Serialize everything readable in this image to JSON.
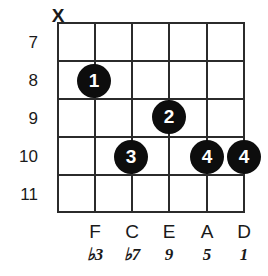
{
  "diagram": {
    "type": "guitar-chord-diagram",
    "instrument": "guitar",
    "string_count": 6,
    "fret_numbers": [
      "7",
      "8",
      "9",
      "10",
      "11"
    ],
    "mute_marker": "X",
    "strings": [
      {
        "index": 1,
        "status": "muted",
        "marker": "X",
        "note": "",
        "interval": "",
        "finger": ""
      },
      {
        "index": 2,
        "status": "fretted",
        "marker": "",
        "note": "F",
        "interval": "♭3",
        "finger": "1",
        "fret": "8"
      },
      {
        "index": 3,
        "status": "fretted",
        "marker": "",
        "note": "C",
        "interval": "♭7",
        "finger": "3",
        "fret": "10"
      },
      {
        "index": 4,
        "status": "fretted",
        "marker": "",
        "note": "E",
        "interval": "9",
        "finger": "2",
        "fret": "9"
      },
      {
        "index": 5,
        "status": "fretted",
        "marker": "",
        "note": "A",
        "interval": "5",
        "finger": "4",
        "fret": "10"
      },
      {
        "index": 6,
        "status": "fretted",
        "marker": "",
        "note": "D",
        "interval": "1",
        "finger": "4",
        "fret": "10"
      }
    ],
    "dots": [
      {
        "label": "1",
        "string": 2,
        "fret": "8"
      },
      {
        "label": "2",
        "string": 4,
        "fret": "9"
      },
      {
        "label": "3",
        "string": 3,
        "fret": "10"
      },
      {
        "label": "4",
        "string": 5,
        "fret": "10"
      },
      {
        "label": "4",
        "string": 6,
        "fret": "10"
      }
    ],
    "note_names": [
      "F",
      "C",
      "E",
      "A",
      "D"
    ],
    "intervals": [
      "♭3",
      "♭7",
      "9",
      "5",
      "1"
    ],
    "colors": {
      "background": "#ffffff",
      "grid": "#2b2b2b",
      "dot_fill": "#0d0d0d",
      "dot_text": "#ffffff",
      "label_text": "#1a1a1a"
    }
  }
}
